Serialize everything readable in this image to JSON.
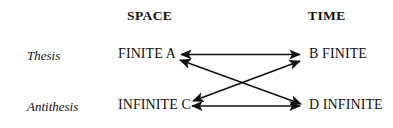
{
  "diagram": {
    "title": "",
    "column_headers": [
      {
        "label": "SPACE",
        "x": 127,
        "y": 21
      },
      {
        "label": "TIME",
        "x": 307,
        "y": 21
      }
    ],
    "row_headers": [
      {
        "label": "Thesis",
        "x": 27,
        "y": 61
      },
      {
        "label": "Antithesis",
        "x": 27,
        "y": 112
      }
    ],
    "nodes": [
      {
        "id": "A",
        "label": "FINITE A",
        "x": 118,
        "y": 60,
        "anchor": "start",
        "row": "Thesis",
        "column": "SPACE"
      },
      {
        "id": "B",
        "label": "B FINITE",
        "x": 309,
        "y": 60,
        "anchor": "start",
        "row": "Thesis",
        "column": "TIME"
      },
      {
        "id": "C",
        "label": "INFINITE C",
        "x": 118,
        "y": 111,
        "anchor": "start",
        "row": "Antithesis",
        "column": "SPACE"
      },
      {
        "id": "D",
        "label": "D INFINITE",
        "x": 309,
        "y": 111,
        "anchor": "start",
        "row": "Antithesis",
        "column": "TIME"
      }
    ],
    "edges": [
      {
        "id": "edge-a-b",
        "from": "A",
        "to": "B",
        "kind": "horizontal-top",
        "direction": "double"
      },
      {
        "id": "edge-c-d",
        "from": "C",
        "to": "D",
        "kind": "horizontal-bottom",
        "direction": "double"
      },
      {
        "id": "edge-a-d",
        "from": "A",
        "to": "D",
        "kind": "diagonal-down-right",
        "direction": "double"
      },
      {
        "id": "edge-b-c",
        "from": "B",
        "to": "C",
        "kind": "diagonal-down-left",
        "direction": "double"
      }
    ],
    "stroke_color": "#111111",
    "background_color": "#ffffff",
    "stroke_width": 1.6
  }
}
